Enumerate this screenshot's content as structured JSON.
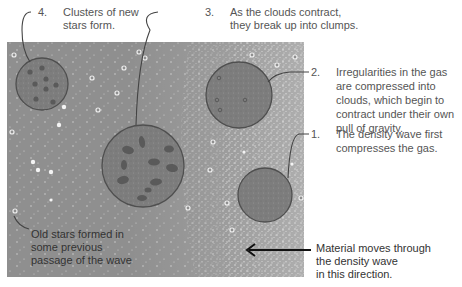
{
  "diagram": {
    "title": "",
    "colors": {
      "panel": "#8f8f8f",
      "cloud": "#7c7c7c",
      "cloud_outline": "#4f4f4f",
      "clump": "#5a5a5a",
      "dots": "#d8d8d8",
      "text": "#555555",
      "arrow": "#111111"
    },
    "labels": [
      {
        "id": "step-4",
        "number": "4.",
        "text_lines": [
          "Clusters of new",
          "stars form."
        ]
      },
      {
        "id": "step-3",
        "number": "3.",
        "text_lines": [
          "As the clouds contract,",
          "they break up into clumps."
        ]
      },
      {
        "id": "step-2",
        "number": "2.",
        "text_lines": [
          "Irregularities in the gas",
          "are compressed into",
          "clouds, which begin to",
          "contract under their own",
          "pull of gravity."
        ]
      },
      {
        "id": "step-1",
        "number": "1.",
        "text_lines": [
          "The density wave first",
          "compresses the gas."
        ]
      }
    ],
    "old_stars": {
      "text_lines": [
        "Old stars formed in",
        "some previous",
        "passage of the wave"
      ]
    },
    "material": {
      "text_lines": [
        "Material moves through",
        "the density wave",
        "in this direction."
      ]
    },
    "arrow_direction": "left"
  }
}
